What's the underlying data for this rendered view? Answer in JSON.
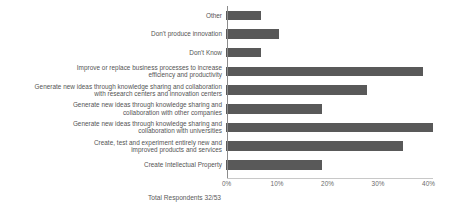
{
  "chart_data": {
    "type": "bar",
    "orientation": "horizontal",
    "title": "",
    "xlabel": "",
    "ylabel": "",
    "xlim": [
      0,
      44
    ],
    "grid": false,
    "legend": null,
    "bar_color": "#595959",
    "axis_color": "#8c8c8c",
    "categories": [
      "Other",
      "Don't produce innovation",
      "Don't Know",
      "Improve or replace business processes to increase\nefficiency and productivity",
      "Generate new ideas through knowledge sharing and collaboration\nwith research centers and innovation centers",
      "Generate new ideas through knowledge sharing and\ncollaboration with other companies",
      "Generate new ideas through knowledge sharing and\ncollaboration with universities",
      "Create, test and experiment entirely new  and\nimproved products and services",
      "Create Intellectual Property"
    ],
    "values": [
      7,
      10.4,
      7,
      39,
      28,
      19,
      41,
      35,
      19
    ],
    "value_unit": "%",
    "tick_labels": [
      "0%",
      "10%",
      "20%",
      "30%",
      "40%"
    ],
    "tick_values": [
      0,
      10,
      20,
      30,
      40
    ],
    "footnote": "Total Respondents 32/53"
  }
}
